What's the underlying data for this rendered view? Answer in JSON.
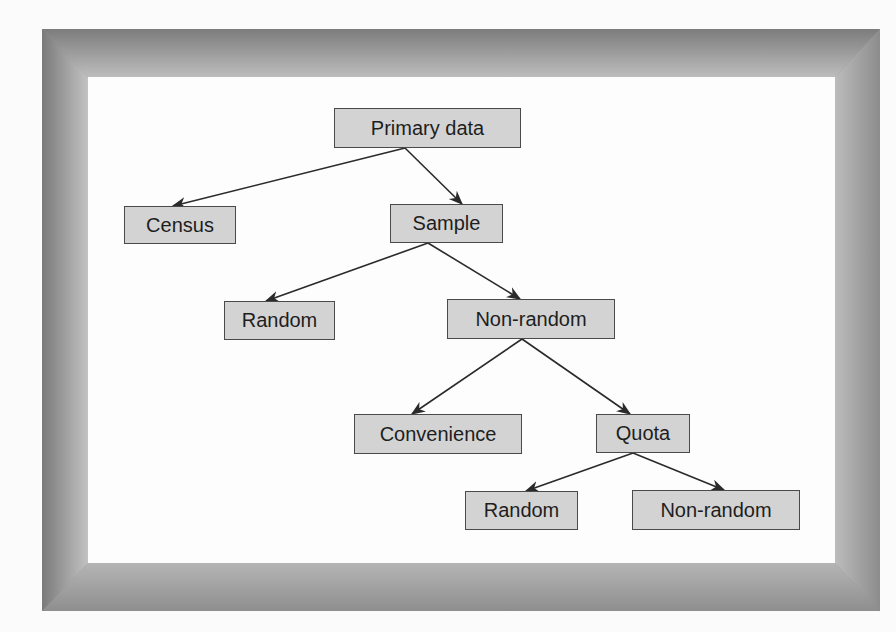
{
  "diagram": {
    "type": "tree",
    "colors": {
      "node_fill": "#d3d3d3",
      "node_border": "#4a4a4a",
      "edge": "#2a2a2a",
      "canvas": "#fdfdfd",
      "frame_dark": "#7a7a7a",
      "frame_light": "#c0c0c0"
    },
    "nodes": {
      "primary_data": "Primary data",
      "census": "Census",
      "sample": "Sample",
      "random": "Random",
      "non_random": "Non-random",
      "convenience": "Convenience",
      "quota": "Quota",
      "quota_random": "Random",
      "quota_non_random": "Non-random"
    },
    "edges": [
      {
        "from": "Primary data",
        "to": "Census"
      },
      {
        "from": "Primary data",
        "to": "Sample"
      },
      {
        "from": "Sample",
        "to": "Random"
      },
      {
        "from": "Sample",
        "to": "Non-random"
      },
      {
        "from": "Non-random",
        "to": "Convenience"
      },
      {
        "from": "Non-random",
        "to": "Quota"
      },
      {
        "from": "Quota",
        "to": "Random"
      },
      {
        "from": "Quota",
        "to": "Non-random"
      }
    ]
  }
}
